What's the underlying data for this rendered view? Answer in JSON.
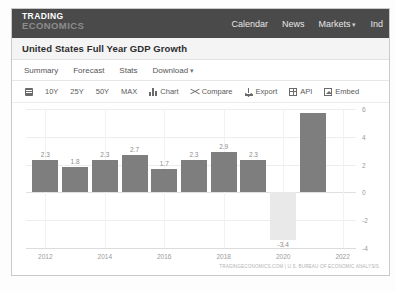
{
  "nav": {
    "logo_line1": "TRADING",
    "logo_line2": "ECONOMICS",
    "links": [
      {
        "label": "Calendar",
        "caret": ""
      },
      {
        "label": "News",
        "caret": ""
      },
      {
        "label": "Markets",
        "caret": "▾"
      },
      {
        "label": "Ind",
        "caret": ""
      }
    ]
  },
  "page_title": "United States Full Year GDP Growth",
  "tabs": [
    {
      "label": "Summary",
      "caret": ""
    },
    {
      "label": "Forecast",
      "caret": ""
    },
    {
      "label": "Stats",
      "caret": ""
    },
    {
      "label": "Download",
      "caret": "▾"
    }
  ],
  "toolbar": {
    "calendar_icon": "calendar-icon",
    "ranges": [
      "10Y",
      "25Y",
      "50Y",
      "MAX"
    ],
    "actions": [
      {
        "label": "Chart",
        "icon": "bar-chart-icon"
      },
      {
        "label": "Compare",
        "icon": "compare-icon"
      },
      {
        "label": "Export",
        "icon": "download-icon"
      },
      {
        "label": "API",
        "icon": "grid-icon"
      },
      {
        "label": "Embed",
        "icon": "image-icon"
      }
    ]
  },
  "source_note": "TRADINGECONOMICS.COM | U.S. BUREAU OF ECONOMIC ANALYSIS",
  "colors": {
    "nav_bg": "#4a4a4a",
    "bar_positive": "#7e7e7e",
    "bar_negative": "#e9e9e9",
    "title_bg": "#f4f4f4"
  },
  "chart_data": {
    "type": "bar",
    "title": "United States Full Year GDP Growth",
    "xlabel": "",
    "ylabel": "",
    "categories": [
      2012,
      2013,
      2014,
      2015,
      2016,
      2017,
      2018,
      2019,
      2020,
      2021
    ],
    "values": [
      2.3,
      1.8,
      2.3,
      2.7,
      1.7,
      2.3,
      2.9,
      2.3,
      -3.4,
      5.7
    ],
    "data_labels": [
      "2.3",
      "1.8",
      "2.3",
      "2.7",
      "1.7",
      "2.3",
      "2.9",
      "2.3",
      "-3.4",
      ""
    ],
    "ylim": [
      -4,
      6
    ],
    "yticks": [
      6,
      4,
      2,
      0,
      -2,
      -4
    ],
    "ytick_labels": [
      "6",
      "4",
      "2",
      "0",
      "-2",
      "-4"
    ],
    "xticks": [
      2012,
      2014,
      2016,
      2018,
      2020,
      2022
    ],
    "xtick_labels": [
      "2012",
      "2014",
      "2016",
      "2018",
      "2020",
      "2022"
    ],
    "grid": true,
    "legend": "none"
  }
}
